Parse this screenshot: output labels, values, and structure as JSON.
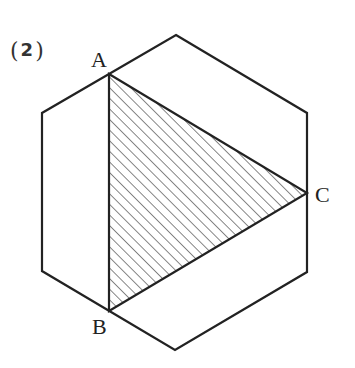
{
  "problem": {
    "number_open": "(",
    "number": "2",
    "number_close": ")"
  },
  "hexagon": {
    "vertices": [
      [
        176,
        35
      ],
      [
        307,
        113
      ],
      [
        307,
        272
      ],
      [
        175,
        350
      ],
      [
        42,
        271
      ],
      [
        42,
        113
      ]
    ],
    "stroke": "#222222"
  },
  "triangle": {
    "vertices": {
      "A": [
        109,
        74
      ],
      "B": [
        109,
        311
      ],
      "C": [
        307,
        193
      ]
    },
    "fill": "hatched",
    "hatch_color": "#666666"
  },
  "labels": {
    "A": "A",
    "B": "B",
    "C": "C"
  }
}
